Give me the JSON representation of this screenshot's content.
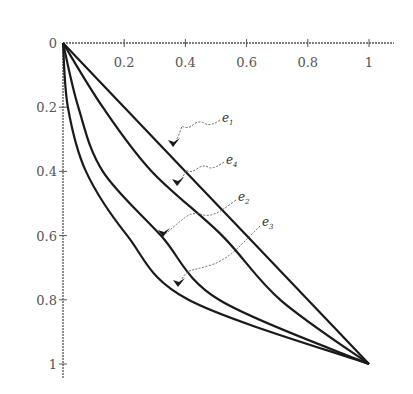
{
  "chart_data": {
    "type": "line",
    "title": "",
    "xlabel": "",
    "ylabel": "",
    "xlim": [
      0,
      1
    ],
    "ylim": [
      0,
      1
    ],
    "y_inverted": true,
    "grid": false,
    "legend": "none (curves labeled by leader-line annotations)",
    "x_ticks": [
      "0.2",
      "0.4",
      "0.6",
      "0.8",
      "1"
    ],
    "y_ticks": [
      "0",
      "0.2",
      "0.4",
      "0.6",
      "0.8",
      "1"
    ],
    "series": [
      {
        "name": "e1",
        "x": [
          0,
          0.2,
          0.4,
          0.6,
          0.8,
          1
        ],
        "y": [
          0,
          0.2,
          0.4,
          0.6,
          0.8,
          1
        ]
      },
      {
        "name": "e4",
        "x": [
          0,
          0.13,
          0.29,
          0.52,
          0.71,
          1
        ],
        "y": [
          0,
          0.2,
          0.4,
          0.6,
          0.8,
          1
        ]
      },
      {
        "name": "e2",
        "x": [
          0,
          0.05,
          0.13,
          0.32,
          0.51,
          1
        ],
        "y": [
          0,
          0.2,
          0.4,
          0.6,
          0.8,
          1
        ]
      },
      {
        "name": "e3",
        "x": [
          0,
          0.016,
          0.075,
          0.21,
          0.41,
          1
        ],
        "y": [
          0,
          0.2,
          0.4,
          0.6,
          0.8,
          1
        ]
      }
    ],
    "annotations": [
      {
        "text": "e1",
        "sub": "1",
        "base": "e"
      },
      {
        "text": "e4",
        "sub": "4",
        "base": "e"
      },
      {
        "text": "e2",
        "sub": "2",
        "base": "e"
      },
      {
        "text": "e3",
        "sub": "3",
        "base": "e"
      }
    ],
    "colors": {
      "line": "#1a1a1a",
      "axis": "#555555",
      "leader": "#666666"
    }
  }
}
